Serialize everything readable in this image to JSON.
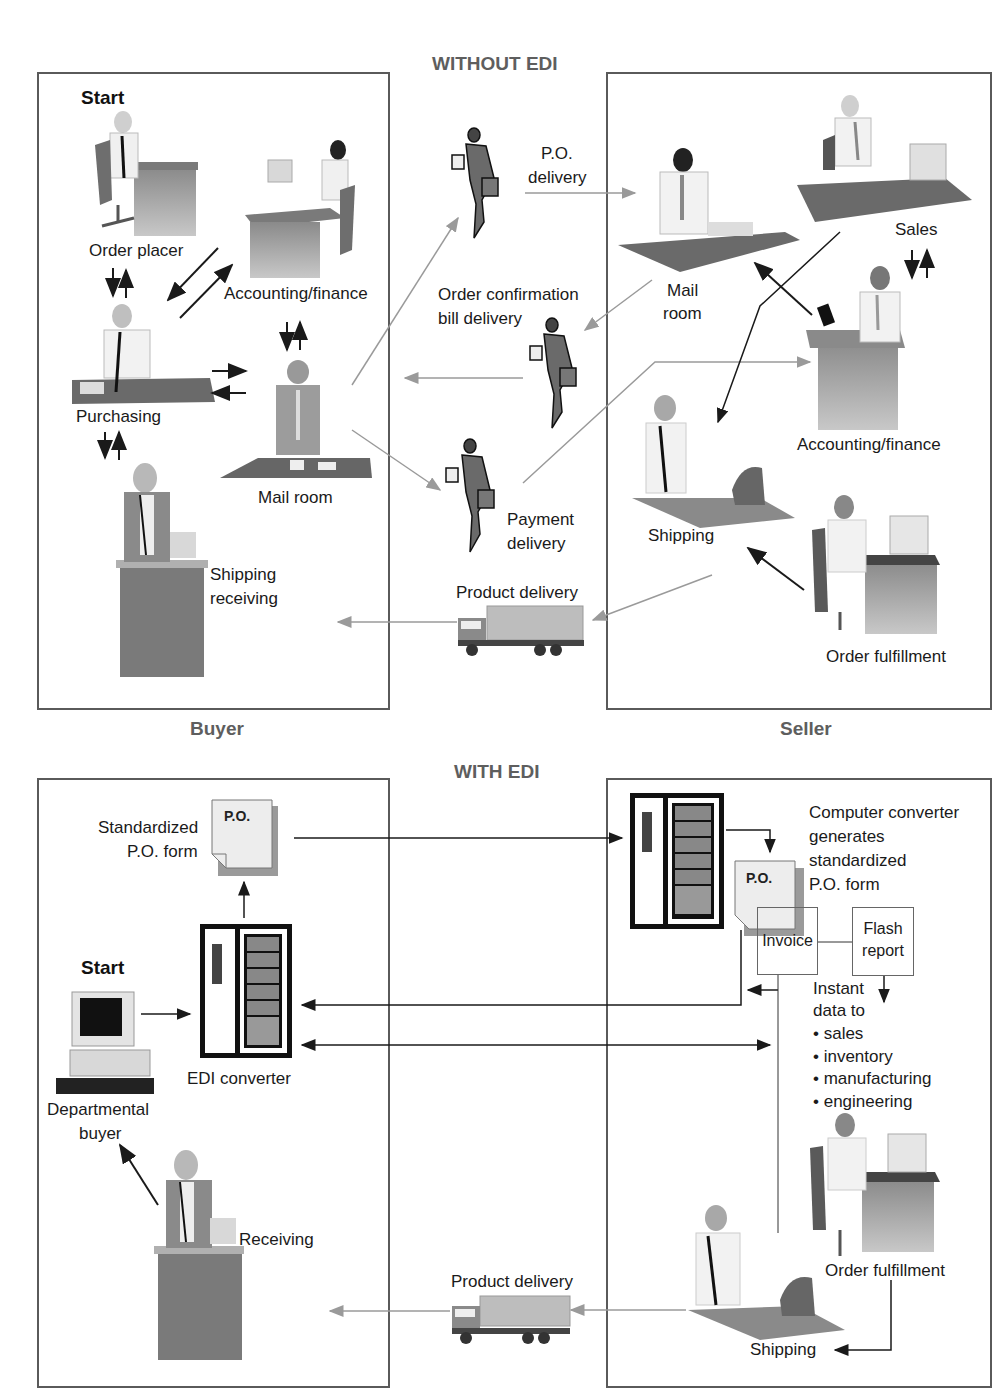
{
  "without_edi": {
    "title": "WITHOUT EDI",
    "buyer_label": "Buyer",
    "seller_label": "Seller",
    "buyer": {
      "start": "Start",
      "order_placer": "Order placer",
      "accounting_finance": "Accounting/finance",
      "purchasing": "Purchasing",
      "mail_room": "Mail room",
      "shipping_receiving_1": "Shipping",
      "shipping_receiving_2": "receiving"
    },
    "middle": {
      "po_delivery_1": "P.O.",
      "po_delivery_2": "delivery",
      "order_confirmation_1": "Order confirmation",
      "order_confirmation_2": "bill delivery",
      "payment_delivery_1": "Payment",
      "payment_delivery_2": "delivery",
      "product_delivery": "Product delivery"
    },
    "seller": {
      "mail_room_1": "Mail",
      "mail_room_2": "room",
      "sales": "Sales",
      "accounting_finance": "Accounting/finance",
      "shipping": "Shipping",
      "order_fulfillment": "Order fulfillment"
    }
  },
  "with_edi": {
    "title": "WITH EDI",
    "buyer": {
      "standardized_1": "Standardized",
      "standardized_2": "P.O. form",
      "po_doc": "P.O.",
      "start": "Start",
      "edi_converter": "EDI converter",
      "departmental_1": "Departmental",
      "departmental_2": "buyer",
      "receiving": "Receiving"
    },
    "middle": {
      "product_delivery": "Product delivery"
    },
    "seller": {
      "converter_text": [
        "Computer converter",
        "generates",
        "standardized",
        "P.O. form"
      ],
      "po_doc": "P.O.",
      "invoice": "Invoice",
      "flash_1": "Flash",
      "flash_2": "report",
      "instant_1": "Instant",
      "instant_2": "data to",
      "bullets": [
        "• sales",
        "• inventory",
        "• manufacturing",
        "• engineering"
      ],
      "order_fulfillment": "Order fulfillment",
      "shipping": "Shipping"
    }
  },
  "colors": {
    "border": "#5a5a5a",
    "title_gray": "#5e5e5e",
    "arrow_dark": "#1a1a1a",
    "arrow_light": "#9a9a9a"
  }
}
